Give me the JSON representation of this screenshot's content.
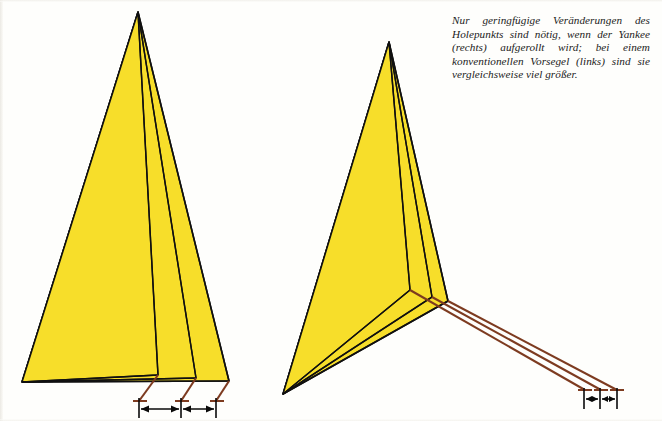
{
  "page": {
    "background_color": "#fdfdfb",
    "width": 662,
    "height": 421
  },
  "caption": {
    "text": "Nur geringfügige Veränderungen des Holepunkts sind nötig, wenn der Yankee (rechts) aufgerollt wird; bei einem konventionellen Vorsegel (links) sind sie vergleichsweise viel größer.",
    "language": "de",
    "style": "italic-serif"
  },
  "colors": {
    "sail_fill": "#f7de2a",
    "sail_fill_shade": "#f2d41f",
    "outline": "#101010",
    "sheet_line": "#7d3b20",
    "arrow": "#0a0a0a"
  },
  "figures": [
    {
      "id": "left-figure",
      "name": "conventional-foresail-diagram",
      "label": "konventionelles Vorsegel (links)",
      "sail_count": 3,
      "note": "Three progressively reefed sail outlines sharing one head and tack; sheet leads fan out to three widely separated hole points.",
      "dimension_segments": 2,
      "dimension_note": "large changes of sheet lead position"
    },
    {
      "id": "right-figure",
      "name": "yankee-sail-diagram",
      "label": "Yankee (rechts)",
      "sail_count": 3,
      "note": "High-clewed Yankee, three reefed sizes; sheet leads remain close together so the hole point moves only slightly.",
      "dimension_segments": 2,
      "dimension_note": "small changes of sheet lead position"
    }
  ]
}
